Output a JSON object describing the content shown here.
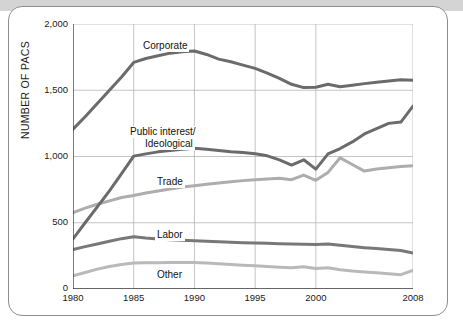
{
  "chart_data": {
    "type": "line",
    "title": "",
    "xlabel": "",
    "ylabel": "NUMBER OF PACS",
    "xlim": [
      1980,
      2008
    ],
    "ylim": [
      0,
      2000
    ],
    "grid": true,
    "legend_position": "inline-labels",
    "x_ticks": [
      "1980",
      "1985",
      "1990",
      "1995",
      "2000",
      "2008"
    ],
    "x_tick_values": [
      1980,
      1985,
      1990,
      1995,
      2000,
      2008
    ],
    "y_ticks": [
      "0",
      "500",
      "1,000",
      "1,500",
      "2,000"
    ],
    "y_tick_values": [
      0,
      500,
      1000,
      1500,
      2000
    ],
    "x": [
      1980,
      1981,
      1982,
      1983,
      1984,
      1985,
      1986,
      1987,
      1988,
      1989,
      1990,
      1991,
      1992,
      1993,
      1994,
      1995,
      1996,
      1997,
      1998,
      1999,
      2000,
      2001,
      2002,
      2003,
      2004,
      2005,
      2006,
      2007,
      2008
    ],
    "series": [
      {
        "name": "Corporate",
        "color": "#6b6b6b",
        "values": [
          1206,
          1300,
          1400,
          1500,
          1600,
          1710,
          1740,
          1760,
          1780,
          1790,
          1796,
          1770,
          1735,
          1715,
          1690,
          1665,
          1630,
          1590,
          1545,
          1520,
          1523,
          1545,
          1527,
          1538,
          1550,
          1560,
          1570,
          1580,
          1575
        ]
      },
      {
        "name": "Public interest/\nIdeological",
        "label_line1": "Public interest/",
        "label_line2": "Ideological",
        "color": "#6b6b6b",
        "values": [
          378,
          500,
          620,
          740,
          870,
          1003,
          1020,
          1035,
          1045,
          1055,
          1062,
          1055,
          1045,
          1035,
          1030,
          1020,
          1005,
          975,
          935,
          975,
          905,
          1020,
          1060,
          1110,
          1170,
          1210,
          1250,
          1260,
          1380
        ]
      },
      {
        "name": "Trade",
        "color": "#adadad",
        "values": [
          576,
          610,
          640,
          665,
          690,
          705,
          725,
          740,
          755,
          770,
          780,
          790,
          800,
          810,
          818,
          825,
          830,
          835,
          825,
          860,
          820,
          880,
          990,
          940,
          890,
          905,
          915,
          925,
          930
        ]
      },
      {
        "name": "Labor",
        "color": "#787878",
        "values": [
          298,
          320,
          340,
          360,
          380,
          394,
          385,
          378,
          372,
          368,
          364,
          360,
          356,
          352,
          350,
          348,
          345,
          342,
          340,
          338,
          336,
          340,
          330,
          320,
          312,
          305,
          298,
          290,
          272
        ]
      },
      {
        "name": "Other",
        "color": "#b9b9b9",
        "values": [
          100,
          125,
          150,
          170,
          185,
          196,
          198,
          199,
          200,
          200,
          200,
          196,
          190,
          185,
          180,
          175,
          170,
          165,
          160,
          168,
          155,
          160,
          145,
          135,
          128,
          122,
          115,
          108,
          140
        ]
      }
    ],
    "annotations": [
      {
        "text": "Corporate",
        "series": "Corporate"
      },
      {
        "text": "Public interest/",
        "series": "Public interest/Ideological"
      },
      {
        "text": "Ideological",
        "series": "Public interest/Ideological"
      },
      {
        "text": "Trade",
        "series": "Trade"
      },
      {
        "text": "Labor",
        "series": "Labor"
      },
      {
        "text": "Other",
        "series": "Other"
      }
    ]
  },
  "labels": {
    "corporate": "Corporate",
    "public_interest_1": "Public interest/",
    "public_interest_2": "Ideological",
    "trade": "Trade",
    "labor": "Labor",
    "other": "Other",
    "y_axis_title": "NUMBER OF PACS"
  }
}
